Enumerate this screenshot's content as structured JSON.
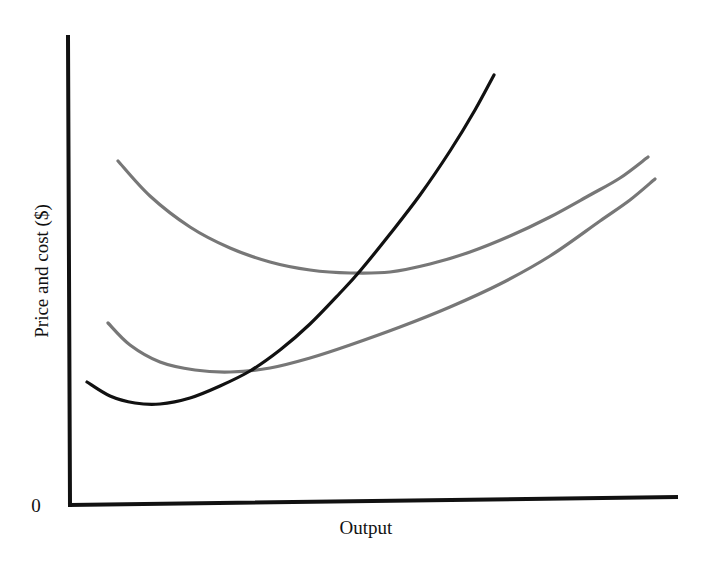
{
  "chart_data": {
    "type": "line",
    "title": "",
    "xlabel": "Output",
    "ylabel": "Price and cost ($)",
    "origin_label": "0",
    "grid": false,
    "legend": "none",
    "x_ticks": [],
    "y_ticks": [
      "0"
    ],
    "series": [
      {
        "name": "Upper U-shaped cost curve (ATC)",
        "color": "#777777",
        "points_px": [
          [
            118,
            161
          ],
          [
            150,
            196
          ],
          [
            190,
            227
          ],
          [
            230,
            248
          ],
          [
            270,
            262
          ],
          [
            310,
            270
          ],
          [
            350,
            273
          ],
          [
            390,
            272
          ],
          [
            430,
            264
          ],
          [
            470,
            252
          ],
          [
            510,
            236
          ],
          [
            550,
            217
          ],
          [
            590,
            195
          ],
          [
            620,
            178
          ],
          [
            648,
            157
          ]
        ]
      },
      {
        "name": "Lower U-shaped cost curve (AVC)",
        "color": "#777777",
        "points_px": [
          [
            108,
            323
          ],
          [
            130,
            345
          ],
          [
            160,
            362
          ],
          [
            195,
            370
          ],
          [
            230,
            372
          ],
          [
            270,
            368
          ],
          [
            310,
            358
          ],
          [
            350,
            345
          ],
          [
            400,
            327
          ],
          [
            450,
            307
          ],
          [
            500,
            284
          ],
          [
            550,
            256
          ],
          [
            600,
            221
          ],
          [
            630,
            200
          ],
          [
            655,
            179
          ]
        ]
      },
      {
        "name": "Black rising curve (MC)",
        "color": "#111111",
        "points_px": [
          [
            87,
            382
          ],
          [
            110,
            396
          ],
          [
            135,
            403
          ],
          [
            160,
            404
          ],
          [
            190,
            398
          ],
          [
            220,
            386
          ],
          [
            250,
            371
          ],
          [
            280,
            350
          ],
          [
            310,
            324
          ],
          [
            340,
            293
          ],
          [
            360,
            271
          ],
          [
            390,
            234
          ],
          [
            420,
            195
          ],
          [
            450,
            151
          ],
          [
            475,
            110
          ],
          [
            494,
            75
          ]
        ]
      }
    ]
  },
  "axes": {
    "origin": [
      70,
      505
    ],
    "y_top": [
      68,
      37
    ],
    "x_end": [
      676,
      497
    ]
  },
  "labels": {
    "x_axis": "Output",
    "y_axis": "Price and cost ($)",
    "origin": "0"
  }
}
